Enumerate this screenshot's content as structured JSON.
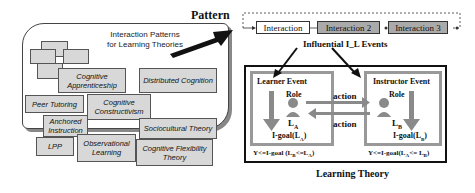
{
  "left_panel": {
    "title_line1": "Interaction Patterns",
    "title_line2": "for Learning Theories",
    "theories": [
      {
        "line1": "Cognitive",
        "line2": "Apprenticeship"
      },
      {
        "line1": "Distributed Cognition",
        "line2": ""
      },
      {
        "line1": "Peer Tutoring",
        "line2": ""
      },
      {
        "line1": "Cognitive",
        "line2": "Constructivism"
      },
      {
        "line1": "Anchored",
        "line2": "Instruction"
      },
      {
        "line1": "Sociocultural Theory",
        "line2": ""
      },
      {
        "line1": "LPP",
        "line2": ""
      },
      {
        "line1": "Observational",
        "line2": "Learning"
      },
      {
        "line1": "Cognitive Flexibility",
        "line2": "Theory"
      }
    ]
  },
  "pattern_label": "Pattern",
  "sequence": {
    "items": [
      "Interaction",
      "Interaction 2",
      "Interaction 3"
    ]
  },
  "influential_label": "Influential I_L Events",
  "learning_theory": {
    "title": "Learning Theory",
    "learner": {
      "title": "Learner Event",
      "role": "Role",
      "agent": "L",
      "agent_sub": "A",
      "goal": "I-goal(L",
      "goal_sub": "A",
      "goal_end": ")",
      "condition": "Y<=I-goal (L",
      "cond_sub1": "B",
      "cond_mid": "<=L",
      "cond_sub2": "A",
      "cond_end": ")"
    },
    "instructor": {
      "title": "Instructor Event",
      "role": "Role",
      "agent": "L",
      "agent_sub": "B",
      "goal": "I-goal(L",
      "goal_sub": "B",
      "goal_end": ")",
      "condition": "Y<=I-goal(L",
      "cond_sub1": "A",
      "cond_mid": "<= L",
      "cond_sub2": "B",
      "cond_end": ")"
    },
    "action_top": "action",
    "action_bottom": "action"
  },
  "colors": {
    "box_fill": "#d8d8d8",
    "event_border": "#999999",
    "arrow_gray": "#8a8a8a",
    "dark": "#111111"
  }
}
